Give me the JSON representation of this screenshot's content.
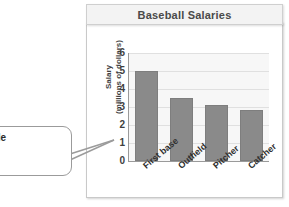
{
  "card": {
    "title": "Baseball Salaries"
  },
  "callout": {
    "lines": [
      "propriate scale",
      "e data is 0 to",
      "ion."
    ]
  },
  "chart_data": {
    "type": "bar",
    "title": "Baseball Salaries",
    "xlabel": "",
    "ylabel_line1": "Salary",
    "ylabel_line2": "(millions of dollars)",
    "categories": [
      "First base",
      "Outfield",
      "Pitcher",
      "Catcher"
    ],
    "values": [
      5.0,
      3.5,
      3.1,
      2.85
    ],
    "ylim": [
      0,
      6
    ],
    "yticks": [
      6,
      5,
      4,
      3,
      2,
      1,
      0
    ],
    "grid": true,
    "legend": "none",
    "bar_color": "#8a8a8a",
    "plot_background": "#f7f7f7"
  }
}
